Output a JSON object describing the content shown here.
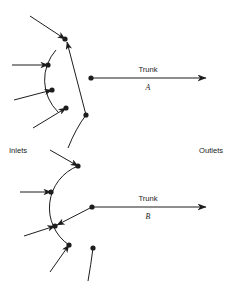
{
  "figure": {
    "title_visible": false,
    "background_color": "#ffffff",
    "line_color": "#1d1d1d",
    "text_color": "#1a1a1a"
  },
  "labels": {
    "inlets": "Inlets",
    "outlets": "Outlets",
    "trunk_word_a": "Trunk",
    "trunk_id_a": "A",
    "trunk_word_b": "Trunk",
    "trunk_id_b": "B"
  },
  "diagram_a": {
    "name": "Trunk A manifold",
    "arc": {
      "cx": 91,
      "cy": 78,
      "r": 45,
      "start_deg": 141,
      "end_deg": 222
    },
    "junction_nodes": [
      {
        "id": "a-n1",
        "x": 65,
        "y": 39
      },
      {
        "id": "a-n2",
        "x": 48,
        "y": 65
      },
      {
        "id": "a-n3",
        "x": 52,
        "y": 90
      },
      {
        "id": "a-n4",
        "x": 66,
        "y": 108
      }
    ],
    "inlet_lines": [
      {
        "from_x": 30,
        "from_y": 16,
        "to_x": 65,
        "to_y": 39
      },
      {
        "from_x": 12,
        "from_y": 65,
        "to_x": 48,
        "to_y": 65
      },
      {
        "from_x": 14,
        "from_y": 100,
        "to_x": 52,
        "to_y": 90
      },
      {
        "from_x": 33,
        "from_y": 128,
        "to_x": 66,
        "to_y": 108
      }
    ],
    "trunk_node": {
      "x": 91,
      "y": 78
    },
    "trunk_arrow": {
      "x1": 91,
      "y1": 78,
      "x2": 206,
      "y2": 78
    },
    "return_branch": {
      "from_x": 86,
      "from_y": 115,
      "to_x": 65,
      "to_y": 39
    },
    "return_node": {
      "x": 86,
      "y": 115
    },
    "return_tail": {
      "from_x": 86,
      "from_y": 115,
      "to_x": 68,
      "to_y": 148
    }
  },
  "diagram_b": {
    "name": "Trunk B manifold",
    "arc": {
      "cx": 92,
      "cy": 207,
      "r": 45,
      "start_deg": 152,
      "end_deg": 238
    },
    "junction_nodes": [
      {
        "id": "b-n1",
        "x": 78,
        "y": 166
      },
      {
        "id": "b-n2",
        "x": 51,
        "y": 192
      },
      {
        "id": "b-n3",
        "x": 55,
        "y": 226
      },
      {
        "id": "b-n4",
        "x": 69,
        "y": 245
      }
    ],
    "inlet_lines": [
      {
        "from_x": 50,
        "from_y": 150,
        "to_x": 78,
        "to_y": 166
      },
      {
        "from_x": 20,
        "from_y": 192,
        "to_x": 51,
        "to_y": 192
      },
      {
        "from_x": 24,
        "from_y": 236,
        "to_x": 55,
        "to_y": 226
      },
      {
        "from_x": 50,
        "from_y": 272,
        "to_x": 69,
        "to_y": 245
      }
    ],
    "trunk_node": {
      "x": 92,
      "y": 207
    },
    "trunk_arrow": {
      "x1": 92,
      "y1": 207,
      "x2": 206,
      "y2": 207
    },
    "return_branch": {
      "from_x": 92,
      "from_y": 207,
      "to_x": 55,
      "to_y": 226
    },
    "return_node": {
      "x": 93,
      "y": 248
    },
    "return_tail": {
      "from_x": 93,
      "from_y": 248,
      "to_x": 88,
      "to_y": 281
    }
  },
  "label_positions": {
    "inlets": {
      "x": 9,
      "y": 153
    },
    "outlets": {
      "x": 199,
      "y": 153
    },
    "trunk_a_word": {
      "x": 148,
      "y": 72
    },
    "trunk_a_id": {
      "x": 148,
      "y": 90
    },
    "trunk_b_word": {
      "x": 148,
      "y": 201
    },
    "trunk_b_id": {
      "x": 148,
      "y": 219
    }
  }
}
